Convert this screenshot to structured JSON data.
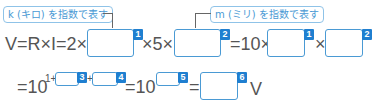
{
  "annotations": {
    "kilo_note": "k (キロ) を指数で表す",
    "milli_note": "m (ミリ) を指数で表す"
  },
  "line1": {
    "lhs": "V=R×I=2×",
    "times5": "×5×",
    "eq10": "=10×",
    "times": "×"
  },
  "line2": {
    "eq10": "=10",
    "exp_prefix": "1+",
    "plus": "+",
    "eq10b": "=10",
    "eq": "=",
    "unit": "V"
  },
  "blanks": {
    "b1": "1",
    "b2": "2",
    "b1b": "1",
    "b2b": "2",
    "b3": "3",
    "b4": "4",
    "b5": "5",
    "b6": "6"
  },
  "colors": {
    "accent": "#1f7fd0",
    "box_border": "#4a9ad4",
    "note_border": "#8fc3e8"
  }
}
